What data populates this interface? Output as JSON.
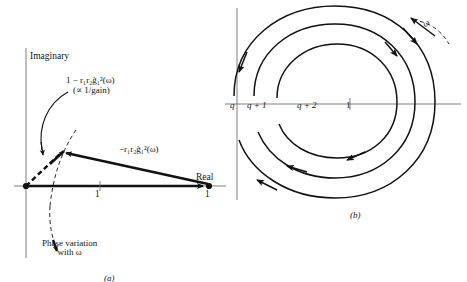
{
  "figure": {
    "panel_a": {
      "caption": "(a)",
      "axis_imaginary_label": "Imaginary",
      "axis_real_label": "Real",
      "gain_expression_line1": "1 − r₁r₂g̃₁²(ω)",
      "gain_expression_line2": "(∝ 1/gain)",
      "vector_expression": "−r₁r₂g̃₁²(ω)",
      "unit_vector_label": "1",
      "unit_tip_label": "1",
      "phase_note_line1": "Phase variation",
      "phase_note_line2": "with ω"
    },
    "panel_b": {
      "caption": "(b)",
      "tick_labels": [
        {
          "name": "q",
          "text": "q"
        },
        {
          "name": "q-plus-1",
          "text": "q + 1"
        },
        {
          "name": "q-plus-2",
          "text": "q + 2"
        },
        {
          "name": "one",
          "text": "1"
        }
      ],
      "omega_label": "ω"
    }
  },
  "colors": {
    "ink": "#111111",
    "axis": "#6f6f6f",
    "background": "#ffffff"
  }
}
